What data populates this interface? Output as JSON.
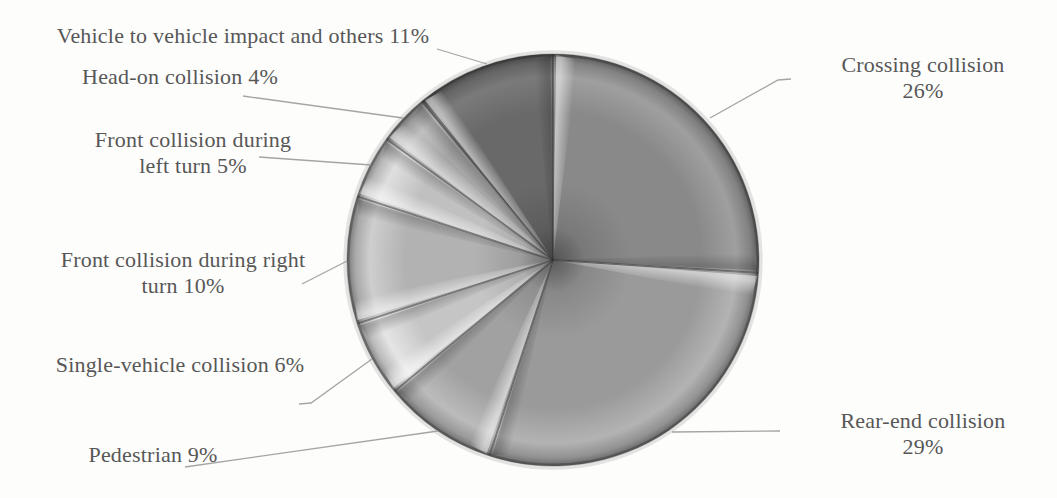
{
  "figure": {
    "background_color": "#fdfdfc",
    "text_color": "#575757",
    "leader_line_color": "#9b9b9b"
  },
  "chart_data": {
    "type": "pie",
    "title": "",
    "unit": "%",
    "direction": "clockwise",
    "start_angle_deg": 0,
    "legend_position": "none",
    "center": {
      "x": 553,
      "y": 260
    },
    "radius": 206,
    "categories": [
      "Crossing collision",
      "Rear-end collision",
      "Pedestrian",
      "Single-vehicle collision",
      "Front collision during right turn",
      "Front collision during left turn",
      "Head-on collision",
      "Vehicle to vehicle impact and others"
    ],
    "values": [
      26,
      29,
      9,
      6,
      10,
      5,
      4,
      11
    ],
    "slices": [
      {
        "label": "Crossing collision",
        "value": 26,
        "color": "#898989",
        "label_lines": [
          "Crossing collision",
          "26%"
        ],
        "label_pos": {
          "x": 923,
          "y": 52
        },
        "leader": [
          [
            710,
            118
          ],
          [
            778,
            80
          ],
          [
            791,
            79
          ]
        ]
      },
      {
        "label": "Rear-end collision",
        "value": 29,
        "color": "#9a9a9a",
        "label_lines": [
          "Rear-end collision",
          "29%"
        ],
        "label_pos": {
          "x": 923,
          "y": 408
        },
        "leader": [
          [
            672,
            432
          ],
          [
            780,
            431
          ]
        ]
      },
      {
        "label": "Pedestrian",
        "value": 9,
        "color": "#a1a1a1",
        "label_lines": [
          "Pedestrian 9%"
        ],
        "label_pos": {
          "x": 153,
          "y": 442
        },
        "leader": [
          [
            185,
            467
          ],
          [
            438,
            431
          ]
        ]
      },
      {
        "label": "Single-vehicle collision",
        "value": 6,
        "color": "#c5c5c5",
        "label_lines": [
          "Single-vehicle collision 6%"
        ],
        "label_pos": {
          "x": 180,
          "y": 352
        },
        "leader": [
          [
            299,
            404
          ],
          [
            311,
            403
          ],
          [
            372,
            359
          ]
        ]
      },
      {
        "label": "Front collision during right turn",
        "value": 10,
        "color": "#b2b2b2",
        "label_lines": [
          "Front collision during right",
          "turn 10%"
        ],
        "label_pos": {
          "x": 183,
          "y": 247
        },
        "leader": [
          [
            302,
            284
          ],
          [
            347,
            261
          ]
        ]
      },
      {
        "label": "Front collision during left turn",
        "value": 5,
        "color": "#c0c0c0",
        "label_lines": [
          "Front collision during",
          "left turn 5%"
        ],
        "label_pos": {
          "x": 193,
          "y": 127
        },
        "leader": [
          [
            259,
            157
          ],
          [
            371,
            165
          ]
        ]
      },
      {
        "label": "Head-on collision",
        "value": 4,
        "color": "#a5a5a5",
        "label_lines": [
          "Head-on collision 4%"
        ],
        "label_pos": {
          "x": 180,
          "y": 64
        },
        "leader": [
          [
            243,
            96
          ],
          [
            403,
            118
          ]
        ]
      },
      {
        "label": "Vehicle to vehicle impact and others",
        "value": 11,
        "color": "#696969",
        "label_lines": [
          "Vehicle to vehicle impact and others 11%"
        ],
        "label_pos": {
          "x": 243,
          "y": 23
        },
        "leader": [
          [
            437,
            49
          ],
          [
            487,
            64
          ]
        ]
      }
    ]
  }
}
